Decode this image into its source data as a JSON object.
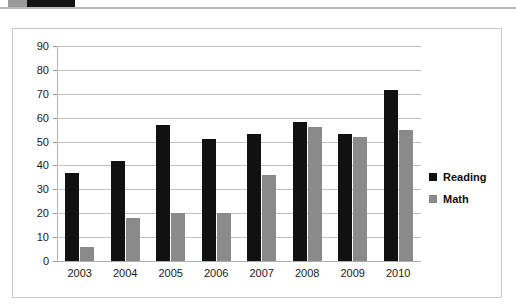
{
  "top_strip": {
    "segment_grey_name": "toolbar-segment-grey",
    "segment_dark_name": "toolbar-segment-dark"
  },
  "colors": {
    "reading": "#111111",
    "math": "#8a8a8a",
    "gridline": "#c2c2c2",
    "frame_border": "#c9c9c9",
    "background": "#ffffff",
    "text": "#1a1a1a"
  },
  "legend": {
    "position": "right",
    "entries": [
      {
        "label": "Reading",
        "color": "#111111"
      },
      {
        "label": "Math",
        "color": "#8a8a8a"
      }
    ]
  },
  "chart_data": {
    "type": "bar",
    "title": "",
    "subtitle": "",
    "xlabel": "",
    "ylabel": "",
    "categories": [
      "2003",
      "2004",
      "2005",
      "2006",
      "2007",
      "2008",
      "2009",
      "2010"
    ],
    "series": [
      {
        "name": "Reading",
        "color": "#111111",
        "values": [
          37,
          42,
          57,
          51,
          53,
          58,
          53,
          71.5
        ]
      },
      {
        "name": "Math",
        "color": "#8a8a8a",
        "values": [
          6,
          18,
          20,
          20,
          36,
          56,
          52,
          55
        ]
      }
    ],
    "ylim": [
      0,
      90
    ],
    "ytick_values": [
      0,
      10,
      20,
      30,
      40,
      50,
      60,
      70,
      80,
      90
    ],
    "ytick_labels": [
      "0",
      "10",
      "20",
      "30",
      "40",
      "50",
      "60",
      "70",
      "80",
      "90"
    ],
    "grid": true,
    "grid_axis": "y",
    "legend_position": "right",
    "bar_orientation": "vertical",
    "grouped": true
  }
}
